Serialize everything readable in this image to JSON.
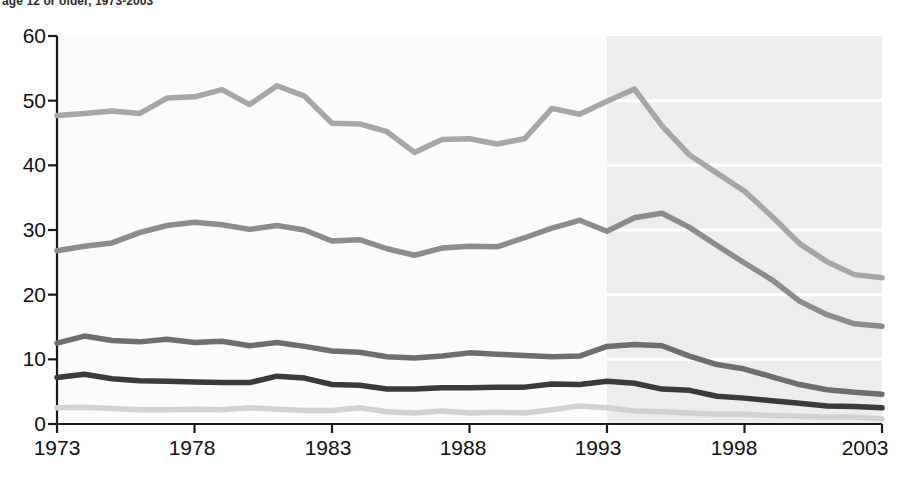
{
  "chart": {
    "subtitle": "age 12 or older, 1973-2003",
    "ylabel": "",
    "xlabel": ""
  },
  "axis": {
    "yticks": [
      "0",
      "10",
      "20",
      "30",
      "40",
      "50",
      "60"
    ],
    "xticks": [
      "1973",
      "1978",
      "1983",
      "1988",
      "1993",
      "1998",
      "2003"
    ]
  },
  "labels": {
    "total": "Total violent crime",
    "simple": "Simple assault",
    "aggravated": "Aggravated assault",
    "robbery": "Robbery",
    "rape": "Rape"
  },
  "colors": {
    "total": "#a6a6a6",
    "simple": "#8c8c8c",
    "aggravated": "#6e6e6e",
    "robbery": "#3a3a3a",
    "rape": "#d2d2d2",
    "shaded_band": "#ededed",
    "gridline": "#ffffff",
    "axis": "#1a1a1a"
  },
  "chart_data": {
    "type": "line",
    "title": "",
    "subtitle": "age 12 or older, 1973-2003",
    "xlabel": "",
    "ylabel": "",
    "xlim": [
      1973,
      2003
    ],
    "ylim": [
      0,
      60
    ],
    "grid": true,
    "legend_position": "inline-labels",
    "annotations": [
      {
        "text": "Redesigned survey period begins",
        "x": 1993,
        "type": "shaded-band",
        "range": [
          1993,
          2003
        ]
      }
    ],
    "x": [
      1973,
      1974,
      1975,
      1976,
      1977,
      1978,
      1979,
      1980,
      1981,
      1982,
      1983,
      1984,
      1985,
      1986,
      1987,
      1988,
      1989,
      1990,
      1991,
      1992,
      1993,
      1994,
      1995,
      1996,
      1997,
      1998,
      1999,
      2000,
      2001,
      2002,
      2003
    ],
    "series": [
      {
        "name": "Total violent crime",
        "values": [
          47.7,
          48.0,
          48.4,
          48.0,
          50.4,
          50.6,
          51.7,
          49.4,
          52.3,
          50.7,
          46.5,
          46.4,
          45.2,
          42.0,
          44.0,
          44.1,
          43.3,
          44.1,
          48.8,
          47.9,
          49.9,
          51.8,
          46.1,
          41.6,
          38.8,
          36.0,
          32.1,
          27.9,
          25.1,
          23.1,
          22.6
        ]
      },
      {
        "name": "Simple assault",
        "values": [
          26.8,
          27.5,
          28.0,
          29.6,
          30.7,
          31.2,
          30.8,
          30.1,
          30.7,
          30.0,
          28.3,
          28.5,
          27.1,
          26.1,
          27.2,
          27.5,
          27.4,
          28.8,
          30.3,
          31.5,
          29.8,
          31.9,
          32.6,
          30.4,
          27.6,
          24.9,
          22.3,
          19.0,
          16.9,
          15.5,
          15.1
        ]
      },
      {
        "name": "Aggravated assault",
        "values": [
          12.5,
          13.6,
          12.9,
          12.7,
          13.1,
          12.6,
          12.8,
          12.1,
          12.6,
          12.0,
          11.3,
          11.1,
          10.4,
          10.2,
          10.5,
          11.0,
          10.8,
          10.6,
          10.4,
          10.5,
          12.0,
          12.3,
          12.1,
          10.5,
          9.2,
          8.5,
          7.3,
          6.1,
          5.3,
          4.9,
          4.6
        ]
      },
      {
        "name": "Robbery",
        "values": [
          7.2,
          7.7,
          7.0,
          6.7,
          6.6,
          6.5,
          6.4,
          6.4,
          7.4,
          7.1,
          6.1,
          6.0,
          5.4,
          5.4,
          5.6,
          5.6,
          5.7,
          5.7,
          6.2,
          6.1,
          6.6,
          6.3,
          5.4,
          5.2,
          4.3,
          4.0,
          3.6,
          3.2,
          2.8,
          2.7,
          2.5
        ]
      },
      {
        "name": "Rape",
        "values": [
          2.5,
          2.6,
          2.4,
          2.2,
          2.2,
          2.3,
          2.2,
          2.5,
          2.3,
          2.1,
          2.1,
          2.5,
          1.9,
          1.7,
          2.0,
          1.7,
          1.8,
          1.7,
          2.2,
          2.8,
          2.5,
          2.0,
          1.9,
          1.7,
          1.5,
          1.5,
          1.3,
          1.2,
          1.1,
          1.1,
          0.8
        ]
      }
    ]
  }
}
